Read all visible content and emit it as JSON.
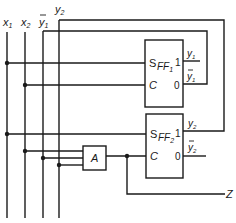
{
  "diagram": {
    "type": "logic-circuit",
    "colors": {
      "line": "#1a1a1a",
      "background": "#ffffff"
    },
    "inputs": [
      {
        "name": "x1",
        "label": "x",
        "sub": "1",
        "overbar": false
      },
      {
        "name": "x2",
        "label": "x",
        "sub": "2",
        "overbar": false
      },
      {
        "name": "y1_bar",
        "label": "y",
        "sub": "1",
        "overbar": true
      },
      {
        "name": "y2",
        "label": "y",
        "sub": "2",
        "overbar": false
      }
    ],
    "flipflops": [
      {
        "name": "FF1",
        "label": "FF",
        "sub": "1",
        "pins": {
          "s": "S",
          "c": "C",
          "q": "1",
          "qbar": "0"
        },
        "outputs": {
          "q_label": "y",
          "q_sub": "1",
          "qbar_label": "y",
          "qbar_sub": "1"
        }
      },
      {
        "name": "FF2",
        "label": "FF",
        "sub": "2",
        "pins": {
          "s": "S",
          "c": "C",
          "q": "1",
          "qbar": "0"
        },
        "outputs": {
          "q_label": "y",
          "q_sub": "2",
          "qbar_label": "y",
          "qbar_sub": "2"
        }
      }
    ],
    "gate": {
      "name": "A",
      "label": "A",
      "type": "AND",
      "inputs": [
        "x2",
        "y1_bar",
        "y2"
      ]
    },
    "output": {
      "name": "Z",
      "label": "Z"
    }
  }
}
